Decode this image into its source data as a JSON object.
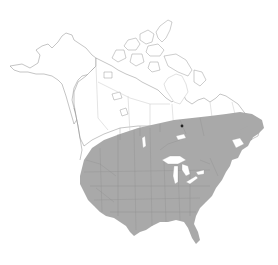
{
  "map": {
    "title": "North America species range map",
    "region": "North America",
    "legend": [],
    "colors": {
      "background": "#ffffff",
      "land": "#ffffff",
      "land_outline": "#8a8a8a",
      "range_fill": "#a9a9a9",
      "state_lines": "#8e8e8e",
      "province_lines": "#d2d2d2",
      "water": "#ffffff"
    },
    "range": {
      "description": "Shaded range covering contiguous United States and southern Canada",
      "areas": [
        "Contiguous United States",
        "Southern Canada",
        "Newfoundland"
      ],
      "excluded": [
        "Alaska",
        "Northern Canada",
        "Arctic Archipelago",
        "Mexico"
      ]
    },
    "markers": [
      {
        "type": "point",
        "name": "isolated-record-dot",
        "location": "Northern Quebec"
      }
    ]
  }
}
